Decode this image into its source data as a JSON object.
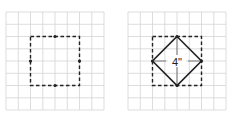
{
  "figures": [
    {
      "id": "left",
      "description": "Dashed square on grid with dots at side midpoints",
      "grid": {
        "cols": 8,
        "rows": 8,
        "color": "#d4d4d4"
      },
      "square": {
        "col_start": 2,
        "row_start": 2,
        "size": 4,
        "style": "dashed"
      },
      "midpoint_dots": 4
    },
    {
      "id": "right",
      "description": "Dashed square with inscribed diamond connecting side midpoints",
      "grid": {
        "cols": 8,
        "rows": 8,
        "color": "#d4d4d4"
      },
      "square": {
        "col_start": 2,
        "row_start": 2,
        "size": 4,
        "style": "dashed"
      },
      "diamond": true,
      "label": "4\""
    }
  ],
  "colors": {
    "grid": "#d4d4d4",
    "ink": "#222222"
  }
}
